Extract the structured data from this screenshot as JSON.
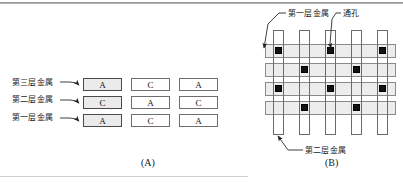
{
  "figure": {
    "panel_a": {
      "caption": "(A)",
      "labels": [
        {
          "text": "第三层金属",
          "meaning": "third-layer-metal"
        },
        {
          "text": "第二层金属",
          "meaning": "second-layer-metal"
        },
        {
          "text": "第一层金属",
          "meaning": "first-layer-metal"
        }
      ],
      "grid": {
        "rows": [
          {
            "row_label": "第三层金属",
            "cells": [
              "A",
              "C",
              "A"
            ]
          },
          {
            "row_label": "第二层金属",
            "cells": [
              "C",
              "A",
              "C"
            ]
          },
          {
            "row_label": "第一层金属",
            "cells": [
              "A",
              "C",
              "A"
            ]
          }
        ]
      }
    },
    "panel_b": {
      "caption": "(B)",
      "labels": [
        {
          "text": "第一层金属",
          "meaning": "first-layer-metal"
        },
        {
          "text": "通孔",
          "meaning": "via"
        },
        {
          "text": "第二层金属",
          "meaning": "second-layer-metal"
        }
      ],
      "horizontal_tracks": 4,
      "vertical_tracks": 5,
      "via_map": [
        [
          1,
          0,
          1,
          0,
          1
        ],
        [
          0,
          1,
          0,
          1,
          0
        ],
        [
          1,
          0,
          1,
          0,
          1
        ],
        [
          0,
          1,
          0,
          1,
          0
        ]
      ]
    },
    "colors": {
      "box_fill": "#ebebeb",
      "box_border": "#4a4a4a",
      "track_fill": "#ededed",
      "track_border": "#8a8a8a",
      "via_fill": "#121212",
      "leader_line": "#2b2b2b",
      "background": "#ffffff"
    }
  }
}
